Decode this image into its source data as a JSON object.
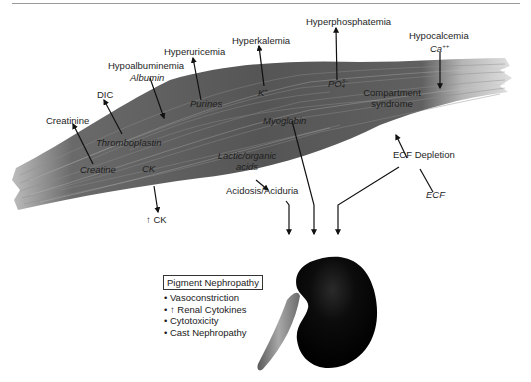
{
  "figure": {
    "colors": {
      "muscle_dark": "#5a5a5a",
      "muscle_light": "#b8b8b8",
      "kidney": "#0a0a0a",
      "ureter": "#8a8a8a",
      "arrow": "#111111"
    }
  },
  "released_substances": [
    {
      "substance": "Creatine",
      "consequence": "Creatinine"
    },
    {
      "substance": "Thromboplastin",
      "consequence": "DIC"
    },
    {
      "substance": "Albumin",
      "consequence": "Hypoalbuminemia"
    },
    {
      "substance": "Purines",
      "consequence": "Hyperuricemia"
    },
    {
      "substance": "K⁺",
      "consequence": "Hyperkalemia"
    },
    {
      "substance": "PO₄³⁻",
      "consequence": "Hyperphosphatemia"
    },
    {
      "substance": "Ca⁺⁺",
      "consequence": "Hypocalcemia"
    },
    {
      "substance": "CK",
      "consequence": "↑ CK"
    },
    {
      "substance": "Lactic/organic acids",
      "consequence": "Acidosis/Aciduria"
    },
    {
      "substance": "Myoglobin",
      "consequence": "Kidney"
    },
    {
      "substance": "ECF",
      "consequence": "ECF Depletion"
    }
  ],
  "labels": {
    "creatinine": "Creatinine",
    "creatine": "Creatine",
    "dic": "DIC",
    "thromboplastin": "Thromboplastin",
    "hypoalbuminemia": "Hypoalbuminemia",
    "albumin": "Albumin",
    "hyperuricemia": "Hyperuricemia",
    "purines": "Purines",
    "hyperkalemia": "Hyperkalemia",
    "k": "K",
    "k_sup": "+",
    "hyperphosphatemia": "Hyperphosphatemia",
    "po4": "PO",
    "po4_sub": "4",
    "po4_sup": "3−",
    "hypocalcemia": "Hypocalcemia",
    "ca": "Ca",
    "ca_sup": "++",
    "compartment_1": "Compartment",
    "compartment_2": "syndrome",
    "myoglobin": "Myoglobin",
    "ck": "CK",
    "ck_up": "↑ CK",
    "lactic_1": "Lactic/organic",
    "lactic_2": "acids",
    "acidosis": "Acidosis/Aciduria",
    "ecf_depletion": "ECF Depletion",
    "ecf": "ECF"
  },
  "pigment_nephropathy": {
    "title": "Pigment Nephropathy",
    "items": [
      "Vasoconstriction",
      "↑ Renal Cytokines",
      "Cytotoxicity",
      "Cast Nephropathy"
    ]
  }
}
